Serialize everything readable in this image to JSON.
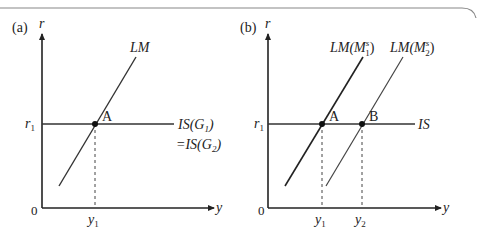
{
  "panels": [
    {
      "label": "(a)",
      "y_axis": "r",
      "x_axis": "y",
      "origin": "0",
      "r_label": "r",
      "r_sub": "1",
      "y_ticks": [
        {
          "main": "y",
          "sub": "1"
        }
      ],
      "curves": {
        "lm": "LM",
        "is_line1": "IS(G",
        "is_sub1": "1",
        "is_line2": "=IS(G",
        "is_sub2": "2",
        "close": ")"
      },
      "points": [
        "A"
      ]
    },
    {
      "label": "(b)",
      "y_axis": "r",
      "x_axis": "y",
      "origin": "0",
      "r_label": "r",
      "r_sub": "1",
      "y_ticks": [
        {
          "main": "y",
          "sub": "1"
        },
        {
          "main": "y",
          "sub": "2"
        }
      ],
      "curves": {
        "lm1_pre": "LM(M",
        "lm1_sup": "s",
        "lm1_sub": "1",
        "lm2_pre": "LM(M",
        "lm2_sup": "s",
        "lm2_sub": "2",
        "close": ")",
        "is": "IS"
      },
      "points": [
        "A",
        "B"
      ]
    }
  ],
  "colors": {
    "line": "#333333",
    "axis": "#222222",
    "frame": "#777777"
  }
}
